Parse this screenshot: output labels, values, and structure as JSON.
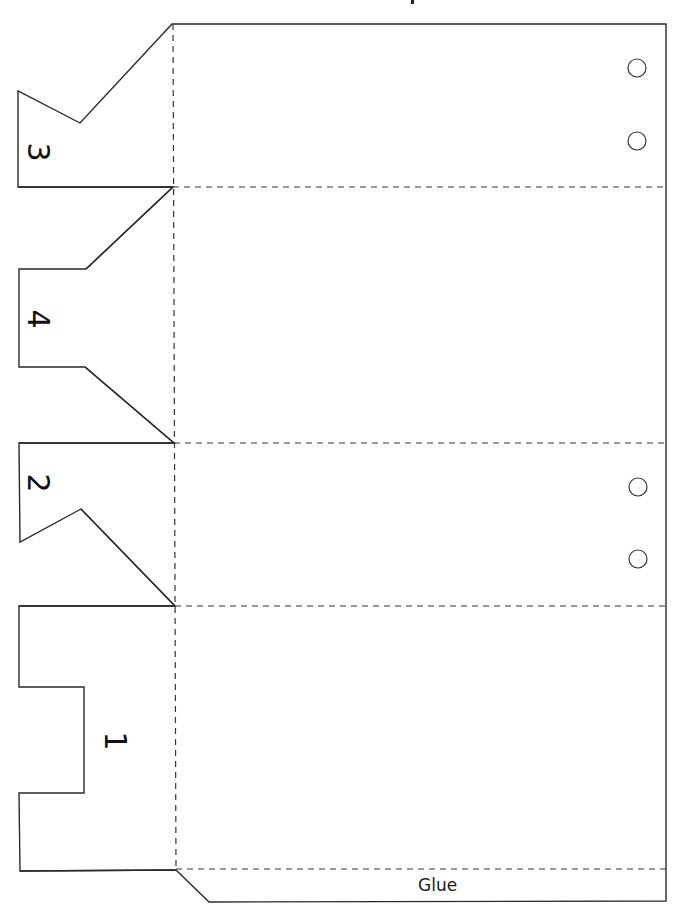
{
  "template": {
    "title_fragment_visible": true,
    "colors": {
      "background": "#ffffff",
      "cut_line": "#2a2a2a",
      "fold_line": "#333333",
      "text": "#111111"
    },
    "outer_outline_points": "172,24 666,24 666,901 209,902 176,870 20,871 19,793 84,793 84,687 19,687 19,606 175,606 81,509 20,542 19,443 174,443 85,367 19,367 19,269 86,269 173,187 18,187 18,91 80,123 172,24",
    "main_panel": {
      "x1": 172,
      "y_top": 24,
      "x_right": 666,
      "y_bottom": 870
    },
    "fold_lines": {
      "vertical": {
        "x1": 173,
        "y1": 24,
        "x2": 176,
        "y2": 870
      },
      "horizontal": [
        {
          "y": 187,
          "x1": 173,
          "x2": 666
        },
        {
          "y": 443,
          "x1": 174,
          "x2": 666
        },
        {
          "y": 606,
          "x1": 175,
          "x2": 666
        },
        {
          "y": 869,
          "x1": 176,
          "x2": 666
        }
      ]
    },
    "inner_tab_edges": [
      {
        "name": "tab-3-bottom-edge",
        "points": "18,187 173,187"
      },
      {
        "name": "tab-4-top-diagonal",
        "points": "86,269 173,187"
      },
      {
        "name": "tab-4-bottom-diagonal",
        "points": "85,367 174,443"
      },
      {
        "name": "tab-2-top-edge",
        "points": "19,443 174,443"
      },
      {
        "name": "tab-2-bottom-diagonal",
        "points": "81,509 175,606"
      },
      {
        "name": "tab-1-top-edge",
        "points": "19,606 175,606"
      },
      {
        "name": "tab-1-bottom-edge",
        "points": "20,871 176,870"
      }
    ],
    "holes": [
      {
        "cx": 637,
        "cy": 68,
        "r": 9
      },
      {
        "cx": 637,
        "cy": 141,
        "r": 9
      },
      {
        "cx": 638,
        "cy": 487,
        "r": 9
      },
      {
        "cx": 638,
        "cy": 559,
        "r": 9
      }
    ],
    "tabs": [
      {
        "id": "3",
        "label": "3",
        "x": 28,
        "y": 137
      },
      {
        "id": "4",
        "label": "4",
        "x": 28,
        "y": 304
      },
      {
        "id": "2",
        "label": "2",
        "x": 28,
        "y": 468
      },
      {
        "id": "1",
        "label": "1",
        "x": 105,
        "y": 726
      }
    ],
    "glue_strip": {
      "label": "Glue",
      "label_x": 418,
      "label_y": 877
    }
  }
}
